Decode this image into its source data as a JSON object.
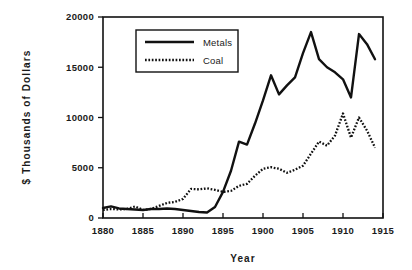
{
  "chart_data": {
    "type": "line",
    "title": "",
    "xlabel": "Year",
    "ylabel": "$ Thousands of Dollars",
    "xlim": [
      1880,
      1915
    ],
    "ylim": [
      0,
      20000
    ],
    "grid": false,
    "legend_position": "top-left-inside",
    "xticks": [
      "1880",
      "1885",
      "1890",
      "1895",
      "1900",
      "1905",
      "1910",
      "1915"
    ],
    "xtick_values": [
      1880,
      1885,
      1890,
      1895,
      1900,
      1905,
      1910,
      1915
    ],
    "yticks": [
      "0",
      "5000",
      "10000",
      "15000",
      "20000"
    ],
    "ytick_values": [
      0,
      5000,
      10000,
      15000,
      20000
    ],
    "x": [
      1880,
      1881,
      1882,
      1883,
      1884,
      1885,
      1886,
      1887,
      1888,
      1889,
      1890,
      1891,
      1892,
      1893,
      1894,
      1895,
      1896,
      1897,
      1898,
      1899,
      1900,
      1901,
      1902,
      1903,
      1904,
      1905,
      1906,
      1907,
      1908,
      1909,
      1910,
      1911,
      1912,
      1913,
      1914
    ],
    "series": [
      {
        "name": "Metals",
        "style": "solid",
        "color": "#111111",
        "values": [
          1000,
          1150,
          950,
          900,
          850,
          800,
          900,
          900,
          950,
          900,
          800,
          700,
          600,
          550,
          1100,
          2600,
          4700,
          7600,
          7300,
          9400,
          11700,
          14200,
          12300,
          13200,
          14000,
          16400,
          18500,
          15800,
          15000,
          14500,
          13800,
          12000,
          18300,
          17300,
          15800
        ]
      },
      {
        "name": "Coal",
        "style": "dotted",
        "color": "#111111",
        "values": [
          800,
          900,
          850,
          900,
          1150,
          800,
          900,
          1200,
          1500,
          1600,
          1900,
          2900,
          2850,
          2950,
          2800,
          2600,
          2700,
          3200,
          3400,
          4200,
          4900,
          5050,
          4900,
          4500,
          4800,
          5200,
          6400,
          7600,
          7200,
          8200,
          10400,
          8000,
          10000,
          8700,
          7000
        ]
      }
    ]
  },
  "legend": {
    "entries": [
      {
        "label": "Metals",
        "style": "solid"
      },
      {
        "label": "Coal",
        "style": "dotted"
      }
    ]
  },
  "axes": {
    "x_title": "Year",
    "y_title": "$ Thousands of Dollars"
  }
}
